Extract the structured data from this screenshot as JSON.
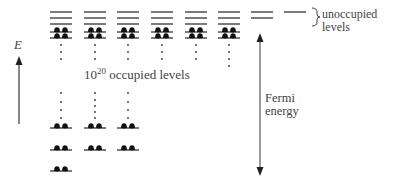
{
  "diagram": {
    "axis": {
      "label": "E",
      "direction": "up"
    },
    "occupied_label": {
      "base": "10",
      "exponent": "20",
      "text": " occupied levels"
    },
    "unoccupied_label": {
      "line1": "unoccupied",
      "line2": "levels"
    },
    "fermi_label": {
      "line1": "Fermi",
      "line2": "energy"
    },
    "columns": [
      {
        "x": 50,
        "unoccupied": 3,
        "top_occupied": 2,
        "dots": true,
        "bottom_occupied": 3
      },
      {
        "x": 84,
        "unoccupied": 3,
        "top_occupied": 2,
        "dots": true,
        "bottom_occupied": 2
      },
      {
        "x": 117,
        "unoccupied": 3,
        "top_occupied": 2,
        "dots": true,
        "bottom_occupied": 2
      },
      {
        "x": 151,
        "unoccupied": 3,
        "top_occupied": 2,
        "dots": true,
        "bottom_occupied": 0
      },
      {
        "x": 185,
        "unoccupied": 3,
        "top_occupied": 2,
        "dots": true,
        "bottom_occupied": 0
      },
      {
        "x": 218,
        "unoccupied": 3,
        "top_occupied": 2,
        "dots": true,
        "bottom_occupied": 0
      },
      {
        "x": 251,
        "unoccupied": 2,
        "top_occupied": 0,
        "dots": false,
        "bottom_occupied": 0
      },
      {
        "x": 284,
        "unoccupied": 1,
        "top_occupied": 0,
        "dots": false,
        "bottom_occupied": 0
      }
    ],
    "colors": {
      "line": "#333333",
      "electron": "#111111",
      "arrow": "#555555"
    }
  }
}
